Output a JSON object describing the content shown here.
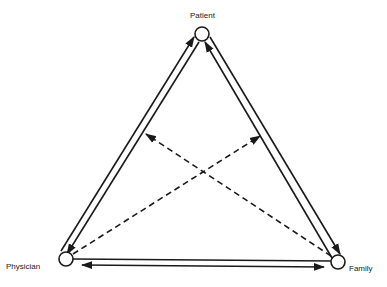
{
  "diagram": {
    "type": "triad-relationship",
    "nodes": [
      {
        "id": "patient",
        "label": "Patient",
        "x": 202,
        "y": 34
      },
      {
        "id": "physician",
        "label": "Physician",
        "x": 66,
        "y": 259
      },
      {
        "id": "family",
        "label": "Family",
        "x": 338,
        "y": 262
      }
    ],
    "edges": [
      {
        "from": "physician",
        "to": "patient",
        "style": "solid",
        "note": "left edge, outer line, arrow toward Patient"
      },
      {
        "from": "patient",
        "to": "physician",
        "style": "solid",
        "note": "left edge, inner line, arrow toward Physician"
      },
      {
        "from": "family",
        "to": "patient",
        "style": "solid",
        "note": "right edge, inner line, arrow toward Patient"
      },
      {
        "from": "patient",
        "to": "family",
        "style": "solid",
        "note": "right edge, outer line, arrow toward Family"
      },
      {
        "from": "physician",
        "to": "family",
        "style": "solid",
        "note": "bottom edge, upper plain line"
      },
      {
        "from": "physician",
        "to": "family",
        "style": "solid",
        "bidirectional": true,
        "note": "bottom edge, lower line with arrows both ends"
      },
      {
        "from": "family",
        "to": "physician-patient-link",
        "style": "dashed",
        "note": "dashed, arrow toward left edge"
      },
      {
        "from": "physician",
        "to": "patient-family-link",
        "style": "dashed",
        "note": "dashed, arrow toward right edge"
      }
    ],
    "colors": {
      "line": "#1a1a1a",
      "background": "#ffffff"
    }
  }
}
